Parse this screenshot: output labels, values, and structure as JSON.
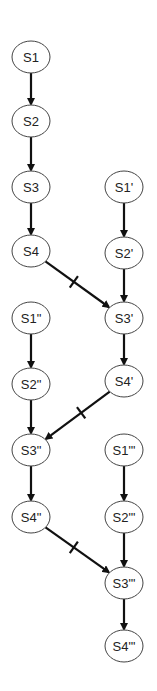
{
  "diagram": {
    "nodes": [
      {
        "id": "S1",
        "label": "S1",
        "x": 31,
        "y": 57
      },
      {
        "id": "S2",
        "label": "S2",
        "x": 31,
        "y": 121
      },
      {
        "id": "S3",
        "label": "S3",
        "x": 31,
        "y": 187
      },
      {
        "id": "S4",
        "label": "S4",
        "x": 31,
        "y": 251
      },
      {
        "id": "S1p",
        "label": "S1'",
        "x": 124,
        "y": 187
      },
      {
        "id": "S2p",
        "label": "S2'",
        "x": 124,
        "y": 253
      },
      {
        "id": "S3p",
        "label": "S3'",
        "x": 124,
        "y": 318
      },
      {
        "id": "S4p",
        "label": "S4'",
        "x": 124,
        "y": 381
      },
      {
        "id": "S1pp",
        "label": "S1\"",
        "x": 31,
        "y": 318
      },
      {
        "id": "S2pp",
        "label": "S2\"",
        "x": 31,
        "y": 384
      },
      {
        "id": "S3pp",
        "label": "S3\"",
        "x": 31,
        "y": 450
      },
      {
        "id": "S4pp",
        "label": "S4\"",
        "x": 31,
        "y": 517
      },
      {
        "id": "S1ppp",
        "label": "S1\"'",
        "x": 124,
        "y": 450
      },
      {
        "id": "S2ppp",
        "label": "S2\"'",
        "x": 124,
        "y": 517
      },
      {
        "id": "S3ppp",
        "label": "S3\"'",
        "x": 124,
        "y": 583
      },
      {
        "id": "S4ppp",
        "label": "S4\"'",
        "x": 124,
        "y": 646
      }
    ],
    "edges": [
      {
        "from": "S1",
        "to": "S2",
        "blocked": false
      },
      {
        "from": "S2",
        "to": "S3",
        "blocked": false
      },
      {
        "from": "S3",
        "to": "S4",
        "blocked": false
      },
      {
        "from": "S4",
        "to": "S3p",
        "blocked": true
      },
      {
        "from": "S1p",
        "to": "S2p",
        "blocked": false
      },
      {
        "from": "S2p",
        "to": "S3p",
        "blocked": false
      },
      {
        "from": "S3p",
        "to": "S4p",
        "blocked": false
      },
      {
        "from": "S4p",
        "to": "S3pp",
        "blocked": true
      },
      {
        "from": "S1pp",
        "to": "S2pp",
        "blocked": false
      },
      {
        "from": "S2pp",
        "to": "S3pp",
        "blocked": false
      },
      {
        "from": "S3pp",
        "to": "S4pp",
        "blocked": false
      },
      {
        "from": "S4pp",
        "to": "S3ppp",
        "blocked": true
      },
      {
        "from": "S1ppp",
        "to": "S2ppp",
        "blocked": false
      },
      {
        "from": "S2ppp",
        "to": "S3ppp",
        "blocked": false
      },
      {
        "from": "S3ppp",
        "to": "S4ppp",
        "blocked": false
      }
    ],
    "style": {
      "node_rx": 19,
      "node_ry": 16,
      "node_stroke": "#444444",
      "edge_color": "#111111"
    }
  }
}
